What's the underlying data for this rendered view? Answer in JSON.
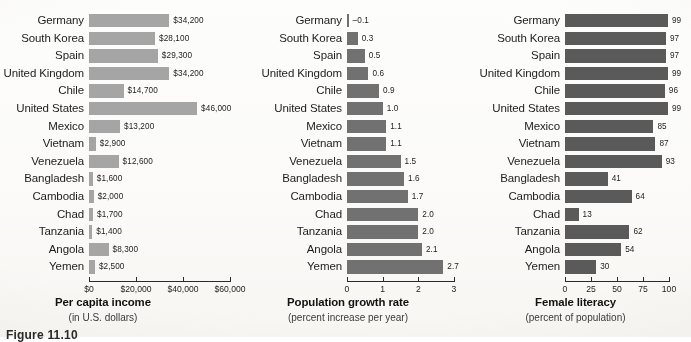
{
  "caption": "Figure 11.10",
  "countries": [
    "Germany",
    "South Korea",
    "Spain",
    "United Kingdom",
    "Chile",
    "United States",
    "Mexico",
    "Vietnam",
    "Venezuela",
    "Bangladesh",
    "Cambodia",
    "Chad",
    "Tanzania",
    "Angola",
    "Yemen"
  ],
  "colors": {
    "income_bar": "#a5a5a5",
    "growth_bar": "#717171",
    "literacy_bar": "#5a5a5a",
    "axis": "#2b2b2b",
    "text": "#1d1d1d",
    "page": "#fbfaf8"
  },
  "chart_data": [
    {
      "type": "bar",
      "orientation": "horizontal",
      "title": "Per capita income",
      "subtitle": "(in U.S. dollars)",
      "xlabel": "Per capita income",
      "ylabel": "",
      "xlim": [
        0,
        60000
      ],
      "grid": false,
      "legend": null,
      "tick_labels": [
        "$0",
        "$20,000",
        "$40,000",
        "$60,000"
      ],
      "ticks": [
        0,
        20000,
        40000,
        60000
      ],
      "categories": [
        "Germany",
        "South Korea",
        "Spain",
        "United Kingdom",
        "Chile",
        "United States",
        "Mexico",
        "Vietnam",
        "Venezuela",
        "Bangladesh",
        "Cambodia",
        "Chad",
        "Tanzania",
        "Angola",
        "Yemen"
      ],
      "values": [
        34200,
        28100,
        29300,
        34200,
        14700,
        46000,
        13200,
        2900,
        12600,
        1600,
        2000,
        1700,
        1400,
        8300,
        2500
      ],
      "value_labels": [
        "$34,200",
        "$28,100",
        "$29,300",
        "$34,200",
        "$14,700",
        "$46,000",
        "$13,200",
        "$2,900",
        "$12,600",
        "$1,600",
        "$2,000",
        "$1,700",
        "$1,400",
        "$8,300",
        "$2,500"
      ]
    },
    {
      "type": "bar",
      "orientation": "horizontal",
      "title": "Population growth rate",
      "subtitle": "(percent increase per year)",
      "xlabel": "Population growth rate",
      "ylabel": "",
      "xlim": [
        0,
        3
      ],
      "grid": false,
      "legend": null,
      "tick_labels": [
        "0",
        "1",
        "2",
        "3"
      ],
      "ticks": [
        0,
        1,
        2,
        3
      ],
      "categories": [
        "Germany",
        "South Korea",
        "Spain",
        "United Kingdom",
        "Chile",
        "United States",
        "Mexico",
        "Vietnam",
        "Venezuela",
        "Bangladesh",
        "Cambodia",
        "Chad",
        "Tanzania",
        "Angola",
        "Yemen"
      ],
      "values": [
        -0.1,
        0.3,
        0.5,
        0.6,
        0.9,
        1.0,
        1.1,
        1.1,
        1.5,
        1.6,
        1.7,
        2.0,
        2.0,
        2.1,
        2.7
      ],
      "value_labels": [
        "–0.1",
        "0.3",
        "0.5",
        "0.6",
        "0.9",
        "1.0",
        "1.1",
        "1.1",
        "1.5",
        "1.6",
        "1.7",
        "2.0",
        "2.0",
        "2.1",
        "2.7"
      ]
    },
    {
      "type": "bar",
      "orientation": "horizontal",
      "title": "Female literacy",
      "subtitle": "(percent of population)",
      "xlabel": "Female literacy",
      "ylabel": "",
      "xlim": [
        0,
        100
      ],
      "grid": false,
      "legend": null,
      "tick_labels": [
        "0",
        "25",
        "50",
        "75",
        "100"
      ],
      "ticks": [
        0,
        25,
        50,
        75,
        100
      ],
      "categories": [
        "Germany",
        "South Korea",
        "Spain",
        "United Kingdom",
        "Chile",
        "United States",
        "Mexico",
        "Vietnam",
        "Venezuela",
        "Bangladesh",
        "Cambodia",
        "Chad",
        "Tanzania",
        "Angola",
        "Yemen"
      ],
      "values": [
        99,
        97,
        97,
        99,
        96,
        99,
        85,
        87,
        93,
        41,
        64,
        13,
        62,
        54,
        30
      ],
      "value_labels": [
        "99",
        "97",
        "97",
        "99",
        "96",
        "99",
        "85",
        "87",
        "93",
        "41",
        "64",
        "13",
        "62",
        "54",
        "30"
      ]
    }
  ]
}
